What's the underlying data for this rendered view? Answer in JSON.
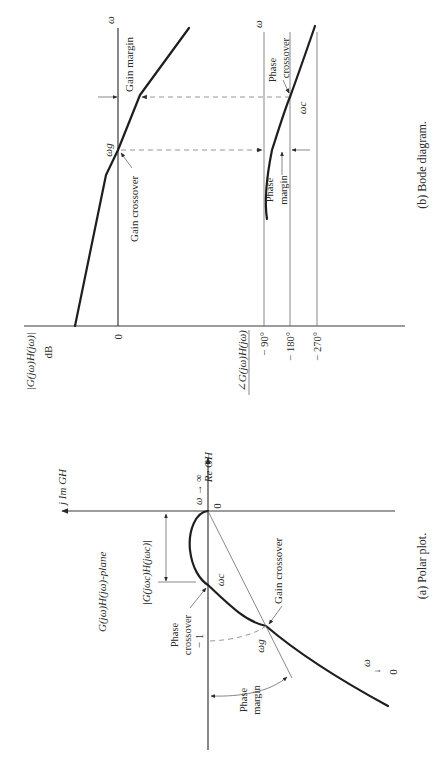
{
  "figure": {
    "bode": {
      "caption": "(b)  Bode diagram.",
      "magnitude": {
        "axis_label": "|G(jω)H(jω)|",
        "unit": "dB",
        "zero_tick": "0",
        "freq_label": "ω",
        "gain_margin_label": "Gain margin",
        "gain_crossover_label": "Gain crossover",
        "omega_g": "ωg"
      },
      "phase": {
        "axis_label": "∠G(jω)H(jω)",
        "ticks": [
          "− 90°",
          "− 180°",
          "− 270°"
        ],
        "freq_label": "ω",
        "phase_crossover_line1": "Phase",
        "phase_crossover_line2": "crossover",
        "phase_margin_line1": "Phase",
        "phase_margin_line2": "margin",
        "omega_c": "ωc"
      }
    },
    "polar": {
      "caption": "(a)  Polar plot.",
      "im_axis_label": "j Im GH",
      "re_axis_label": "Re GH",
      "plane_label": "G(jω)H(jω)-plane",
      "magnitude_label": "|G(jωc)H(jωc)|",
      "omega_inf": "ω → ∞",
      "origin": "0",
      "minus_one": "− 1",
      "omega_c": "ωc",
      "omega_g": "ωg",
      "omega_zero_w": "ω",
      "omega_zero_arrow": "↓",
      "omega_zero_0": "0",
      "phase_crossover_line1": "Phase",
      "phase_crossover_line2": "crossover",
      "gain_crossover_label": "Gain crossover",
      "phase_margin_line1": "Phase",
      "phase_margin_line2": "margin"
    }
  }
}
